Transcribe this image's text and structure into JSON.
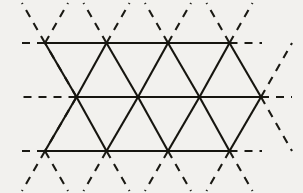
{
  "figure": {
    "type": "geometric-lattice-diagram",
    "width": 303,
    "height": 193,
    "background_color": "#f2f1ee",
    "line_color": "#16150f",
    "line_width": 2.1,
    "dash_pattern": "8 7"
  },
  "geometry": {
    "row_spacing": 54,
    "column_spacing": 61.5,
    "row_y": [
      43,
      97,
      151
    ],
    "row_offsets": [
      45,
      76.5,
      45
    ],
    "nodes_per_row": 4,
    "rows": [
      {
        "name": "top-row",
        "y": 43,
        "node_x": [
          45,
          106.5,
          168,
          229.5
        ],
        "solid_span": [
          45,
          229.5
        ],
        "dash_left_to": 21,
        "dash_right_to": 262
      },
      {
        "name": "middle-row",
        "y": 97,
        "node_x": [
          76.5,
          138,
          199.5,
          261
        ],
        "solid_span": [
          76.5,
          261
        ],
        "dash_left_to": 22,
        "dash_right_to": 292
      },
      {
        "name": "bottom-row",
        "y": 151,
        "node_x": [
          45,
          106.5,
          168,
          229.5
        ],
        "solid_span": [
          45,
          229.5
        ],
        "dash_left_to": 21,
        "dash_right_to": 262
      }
    ]
  },
  "chart_data": {
    "type": "line",
    "xlabel": "",
    "ylabel": "",
    "xlim": [
      0,
      303
    ],
    "ylim": [
      0,
      193
    ],
    "grid": false,
    "legend": "none",
    "series": [
      {
        "name": "horizontal-solid-lines",
        "style": "solid",
        "segments": [
          [
            45,
            43,
            229.5,
            43
          ],
          [
            76.5,
            97,
            261,
            97
          ],
          [
            45,
            151,
            229.5,
            151
          ]
        ]
      },
      {
        "name": "down-right-solid-diagonals",
        "style": "solid",
        "segments": [
          [
            45,
            43,
            76.5,
            97
          ],
          [
            106.5,
            43,
            138,
            97
          ],
          [
            168,
            43,
            199.5,
            97
          ],
          [
            229.5,
            43,
            261,
            97
          ],
          [
            76.5,
            97,
            106.5,
            151
          ],
          [
            138,
            97,
            168,
            151
          ],
          [
            199.5,
            97,
            229.5,
            151
          ]
        ]
      },
      {
        "name": "down-left-solid-diagonals",
        "style": "solid",
        "segments": [
          [
            106.5,
            43,
            76.5,
            97
          ],
          [
            168,
            43,
            138,
            97
          ],
          [
            229.5,
            43,
            199.5,
            97
          ],
          [
            76.5,
            97,
            45,
            151
          ],
          [
            138,
            97,
            106.5,
            151
          ],
          [
            199.5,
            97,
            168,
            151
          ],
          [
            261,
            97,
            229.5,
            151
          ]
        ]
      },
      {
        "name": "horizontal-dashed-extensions",
        "style": "dashed",
        "segments": [
          [
            45,
            43,
            21,
            43
          ],
          [
            229.5,
            43,
            262,
            43
          ],
          [
            76.5,
            97,
            22,
            97
          ],
          [
            261,
            97,
            292,
            97
          ],
          [
            45,
            151,
            21,
            151
          ],
          [
            229.5,
            151,
            262,
            151
          ]
        ]
      },
      {
        "name": "upward-dashed-diagonals-above-top-row",
        "style": "dashed",
        "segments": [
          [
            45,
            43,
            22,
            3
          ],
          [
            45,
            43,
            68,
            3
          ],
          [
            106.5,
            43,
            83.5,
            3
          ],
          [
            106.5,
            43,
            129.5,
            3
          ],
          [
            168,
            43,
            145,
            3
          ],
          [
            168,
            43,
            191,
            3
          ],
          [
            229.5,
            43,
            206.5,
            3
          ],
          [
            229.5,
            43,
            252.5,
            3
          ]
        ]
      },
      {
        "name": "dashed-diagonals-outside-middle-row",
        "style": "dashed",
        "segments": [
          [
            76.5,
            97,
            45,
            43
          ],
          [
            76.5,
            97,
            45,
            151
          ],
          [
            261,
            97,
            292,
            43
          ],
          [
            261,
            97,
            292,
            151
          ]
        ]
      },
      {
        "name": "downward-dashed-diagonals-below-bottom-row",
        "style": "dashed",
        "segments": [
          [
            45,
            151,
            22,
            191
          ],
          [
            45,
            151,
            68,
            191
          ],
          [
            106.5,
            151,
            83.5,
            191
          ],
          [
            106.5,
            151,
            129.5,
            191
          ],
          [
            168,
            151,
            145,
            191
          ],
          [
            168,
            151,
            191,
            191
          ],
          [
            229.5,
            151,
            206.5,
            191
          ],
          [
            229.5,
            151,
            252.5,
            191
          ]
        ]
      }
    ]
  }
}
